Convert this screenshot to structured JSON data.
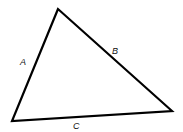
{
  "diagram": {
    "type": "triangle",
    "vertices": [
      [
        58,
        9
      ],
      [
        12,
        121
      ],
      [
        172,
        111
      ]
    ],
    "stroke_color": "#000000",
    "labels": {
      "side_a": "A",
      "side_b": "B",
      "side_c": "C"
    }
  }
}
